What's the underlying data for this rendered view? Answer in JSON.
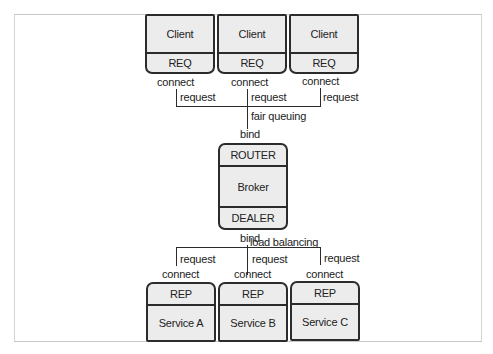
{
  "diagram": {
    "clients": [
      {
        "name": "Client",
        "socket": "REQ",
        "connect_label": "connect",
        "edge_label": "request"
      },
      {
        "name": "Client",
        "socket": "REQ",
        "connect_label": "connect",
        "edge_label": "request"
      },
      {
        "name": "Client",
        "socket": "REQ",
        "connect_label": "connect",
        "edge_label": "request"
      }
    ],
    "upstream_label": "fair queuing",
    "broker": {
      "frontend_bind_label": "bind",
      "frontend_socket": "ROUTER",
      "name": "Broker",
      "backend_socket": "DEALER",
      "backend_bind_label": "bind"
    },
    "downstream_label": "load balancing",
    "services": [
      {
        "name": "Service A",
        "socket": "REP",
        "connect_label": "connect",
        "edge_label": "request"
      },
      {
        "name": "Service B",
        "socket": "REP",
        "connect_label": "connect",
        "edge_label": "request"
      },
      {
        "name": "Service C",
        "socket": "REP",
        "connect_label": "connect",
        "edge_label": "request"
      }
    ],
    "colors": {
      "box_fill": "#ececec",
      "stroke": "#2b2b2b",
      "frame": "#c8c8c8"
    }
  }
}
